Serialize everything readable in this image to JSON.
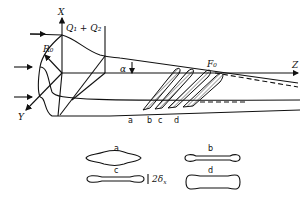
{
  "diagram": {
    "axes": {
      "x_label": "X",
      "y_label": "Y",
      "z_label": "Z"
    },
    "labels": {
      "flow": "Q₁ + Q₂",
      "radius": "R₀",
      "angle": "α",
      "focus": "F₀"
    },
    "sections": [
      "a",
      "b",
      "c",
      "d"
    ],
    "cross_sections": [
      {
        "label": "a",
        "shape": "lens"
      },
      {
        "label": "b",
        "shape": "dumbbell-thin"
      },
      {
        "label": "c",
        "shape": "dumbbell"
      },
      {
        "label": "d",
        "shape": "rounded-rect"
      }
    ],
    "thickness_label": "2δ",
    "thickness_subscript": "x"
  }
}
